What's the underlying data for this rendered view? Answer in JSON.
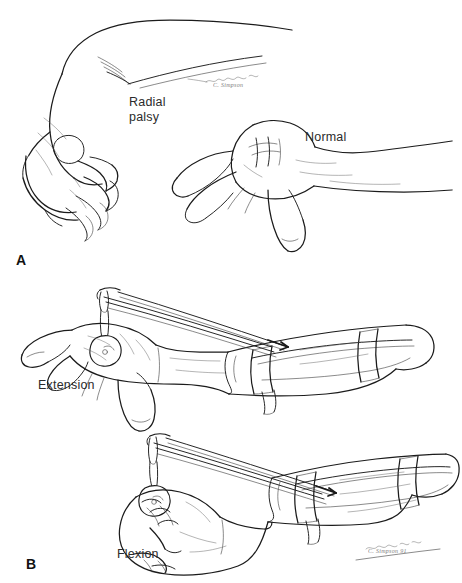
{
  "figure": {
    "background_color": "#ffffff",
    "ink_color": "#1b1b1b",
    "text_color": "#2b2b2b",
    "width": 462,
    "height": 583
  },
  "panels": [
    {
      "letter": "A",
      "name": "radial-palsy-vs-normal",
      "labels": [
        {
          "name": "radial-palsy",
          "text": "Radial\npalsy",
          "x": 129,
          "y": 95
        },
        {
          "name": "normal",
          "text": "Normal",
          "x": 305,
          "y": 130
        }
      ],
      "signature": {
        "text": "C. Simpson",
        "x": 213,
        "y": 82
      }
    },
    {
      "letter": "B",
      "name": "dynamic-extension-splint",
      "labels": [
        {
          "name": "extension",
          "text": "Extension",
          "x": 38,
          "y": 378
        },
        {
          "name": "flexion",
          "text": "Flexion",
          "x": 117,
          "y": 547
        }
      ],
      "signature": {
        "text": "C. Simpson 91",
        "x": 368,
        "y": 548
      }
    }
  ],
  "panel_letters": [
    {
      "name": "panel-letter-a",
      "text": "A",
      "x": 16,
      "y": 252
    },
    {
      "name": "panel-letter-b",
      "text": "B",
      "x": 26,
      "y": 556
    }
  ],
  "illustration_subjects": [
    {
      "name": "radial-palsy-hand",
      "description": "Left hand and forearm showing wrist drop: wrist flexed, fingers and thumb drooping, characteristic of radial nerve palsy"
    },
    {
      "name": "normal-hand",
      "description": "Right hand and forearm in normal posture with wrist held in neutral extension"
    },
    {
      "name": "extension-splint-view",
      "description": "Forearm-based dynamic outrigger splint, finger sling elevated by elastic traction, fingers extended"
    },
    {
      "name": "flexion-splint-view",
      "description": "Same dynamic outrigger splint with hand making a fist, elastic band stretched during active flexion"
    }
  ]
}
